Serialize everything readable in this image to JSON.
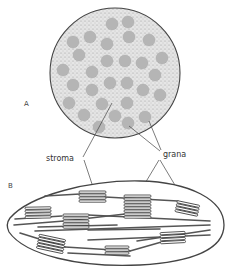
{
  "figure": {
    "panels": [
      {
        "id": "A",
        "label": "A",
        "description": "cross-section of chloroplast showing grana embedded in stroma"
      },
      {
        "id": "B",
        "label": "B",
        "description": "longitudinal section of chloroplast showing stacked grana connected by lamellae"
      }
    ],
    "labels": {
      "stroma": "stroma",
      "grana": "grana"
    },
    "colors": {
      "outline": "#444444",
      "stroma_fill": "#dcdcdc",
      "granum_fill": "#b5b5b5",
      "lamella_fill": "#ffffff"
    }
  },
  "panel_a": {
    "circle": {
      "cx": 115,
      "cy": 73,
      "r": 65
    },
    "grana": [
      [
        112,
        24
      ],
      [
        128,
        22
      ],
      [
        73,
        42
      ],
      [
        90,
        37
      ],
      [
        107,
        44
      ],
      [
        129,
        37
      ],
      [
        149,
        40
      ],
      [
        79,
        55
      ],
      [
        107,
        61
      ],
      [
        125,
        61
      ],
      [
        142,
        63
      ],
      [
        162,
        58
      ],
      [
        63,
        70
      ],
      [
        92,
        72
      ],
      [
        155,
        75
      ],
      [
        73,
        85
      ],
      [
        92,
        90
      ],
      [
        110,
        83
      ],
      [
        127,
        83
      ],
      [
        143,
        90
      ],
      [
        160,
        95
      ],
      [
        69,
        103
      ],
      [
        102,
        104
      ],
      [
        127,
        103
      ],
      [
        84,
        115
      ],
      [
        115,
        116
      ],
      [
        145,
        117
      ],
      [
        99,
        127
      ],
      [
        128,
        123
      ]
    ]
  }
}
